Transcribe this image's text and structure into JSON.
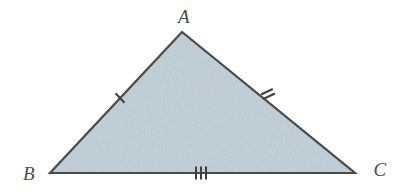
{
  "figure": {
    "kind": "geometry-diagram",
    "shape": "triangle",
    "background_color": "#ffffff",
    "fill_color": "#c6d4dd",
    "stroke_color": "#4a4a4a",
    "label_color": "#4d4d4d",
    "tick_color": "#3f3f3f",
    "stroke_width": 2.2,
    "tick_width": 2.0
  },
  "vertices": [
    {
      "id": "A",
      "label": "A",
      "x": 182,
      "y": 32,
      "label_x": 184,
      "label_y": 23,
      "label_anchor": "middle",
      "role": "apex"
    },
    {
      "id": "B",
      "label": "B",
      "x": 50,
      "y": 173,
      "label_x": 29,
      "label_y": 180,
      "label_anchor": "middle",
      "role": "bottom-left"
    },
    {
      "id": "C",
      "label": "C",
      "x": 355,
      "y": 173,
      "label_x": 380,
      "label_y": 176,
      "label_anchor": "middle",
      "role": "bottom-right"
    }
  ],
  "sides": [
    {
      "id": "AB",
      "from": "B",
      "to": "A",
      "tick_count": 1,
      "tick_label": "single tick",
      "tick_center_x": 120,
      "tick_center_y": 98,
      "tick_length": 13,
      "tick_spacing": 4,
      "tick_angle_deg": 47
    },
    {
      "id": "AC",
      "from": "A",
      "to": "C",
      "tick_count": 2,
      "tick_label": "double tick",
      "tick_center_x": 268,
      "tick_center_y": 94,
      "tick_length": 13,
      "tick_spacing": 5,
      "tick_angle_deg": 155
    },
    {
      "id": "BC",
      "from": "B",
      "to": "C",
      "tick_count": 3,
      "tick_label": "triple tick",
      "tick_center_x": 201,
      "tick_center_y": 173,
      "tick_length": 13,
      "tick_spacing": 5,
      "tick_angle_deg": 90
    }
  ]
}
